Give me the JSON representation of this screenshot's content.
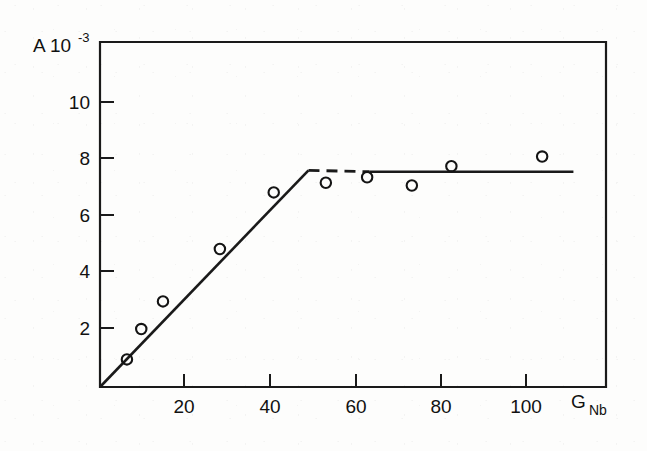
{
  "figure": {
    "background_color": "#fdfdfc",
    "ink_color": "#1a1a1a"
  },
  "chart_data": {
    "type": "scatter",
    "title": "",
    "subtitle": "",
    "xlabel": "G Nb",
    "xlabel_main": "G",
    "xlabel_sub": "Nb",
    "ylabel": "A 10-3",
    "ylabel_main": "A 10",
    "ylabel_sup": "-3",
    "xlim": [
      0,
      116.5
    ],
    "ylim": [
      0,
      12.5
    ],
    "xticks": [
      20,
      40,
      60,
      80,
      100
    ],
    "yticks": [
      2,
      4,
      6,
      8,
      10
    ],
    "xtick_labels": [
      "20",
      "40",
      "60",
      "80",
      "100"
    ],
    "ytick_labels": [
      "2",
      "4",
      "6",
      "8",
      "10"
    ],
    "grid": false,
    "legend": "none",
    "frame": "box",
    "marker_style": "open-circle",
    "points": [
      {
        "x": 6.2,
        "y": 1.0
      },
      {
        "x": 9.5,
        "y": 2.1
      },
      {
        "x": 14.5,
        "y": 3.1
      },
      {
        "x": 27.6,
        "y": 5.0
      },
      {
        "x": 40.0,
        "y": 7.05
      },
      {
        "x": 52.0,
        "y": 7.4
      },
      {
        "x": 61.5,
        "y": 7.6
      },
      {
        "x": 71.8,
        "y": 7.3
      },
      {
        "x": 80.9,
        "y": 8.0
      },
      {
        "x": 101.8,
        "y": 8.35
      }
    ],
    "series": [
      {
        "name": "measured",
        "x": [
          6.2,
          9.5,
          14.5,
          27.6,
          40.0,
          52.0,
          61.5,
          71.8,
          80.9,
          101.8
        ],
        "values": [
          1.0,
          2.1,
          3.1,
          5.0,
          7.05,
          7.4,
          7.6,
          7.3,
          8.0,
          8.35
        ]
      }
    ],
    "fit_line": {
      "description": "piecewise linear fit: linear rise from origin to saturation knee, then constant plateau",
      "knee": {
        "x": 48.0,
        "y": 7.85
      },
      "rising_segment": {
        "x0": 0,
        "y0": 0,
        "x1": 48.0,
        "y1": 7.85,
        "style": "solid"
      },
      "dashed_segment": {
        "x0": 48.0,
        "y0": 7.85,
        "x1": 62.0,
        "y1": 7.8,
        "style": "dashed"
      },
      "plateau_segment": {
        "x0": 62.0,
        "y0": 7.8,
        "x1": 109.0,
        "y1": 7.8,
        "style": "solid"
      }
    }
  }
}
